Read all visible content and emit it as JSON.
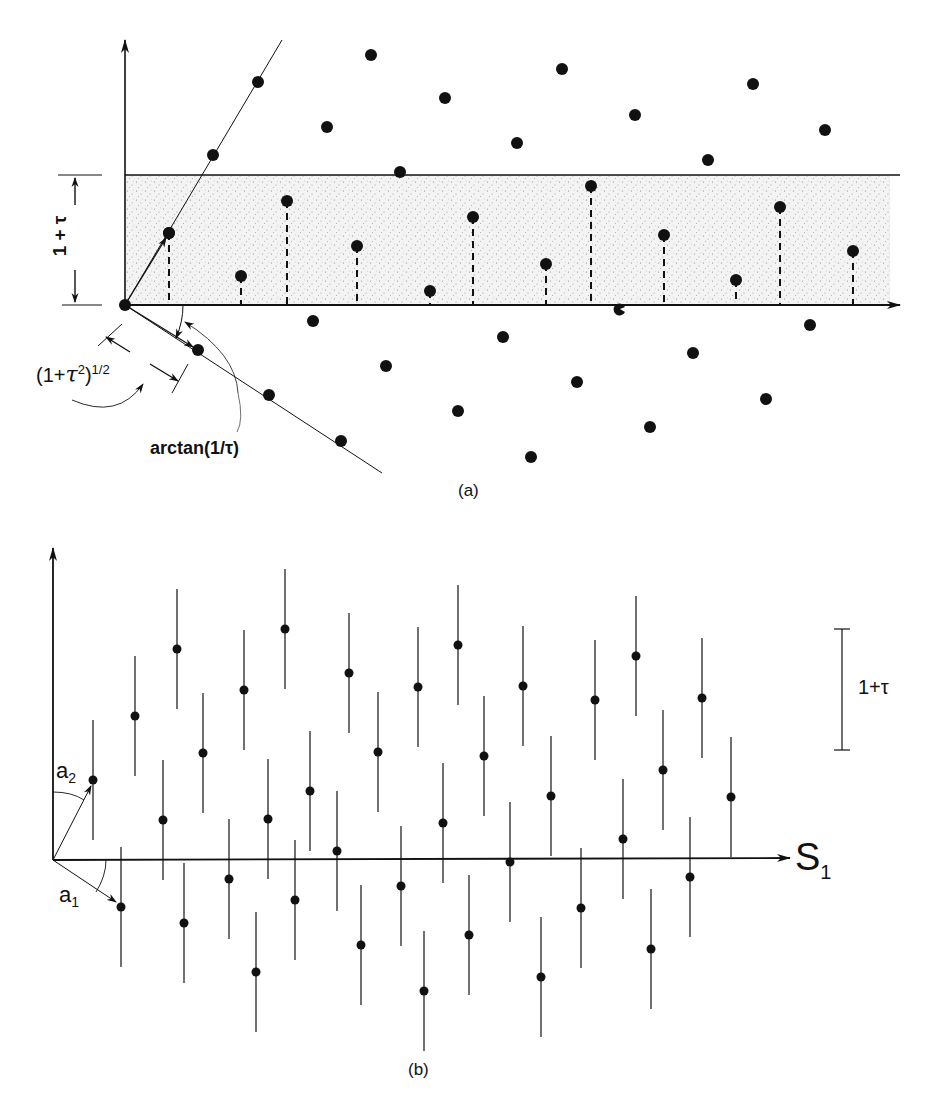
{
  "panel_a": {
    "caption": "(a)",
    "band_label": "1 + τ",
    "length_label": "(1+τ²)^1/2",
    "length_label_base": "(1+",
    "length_label_tau": "τ",
    "length_label_sq": "2",
    "length_label_close": ")",
    "length_label_exp": "1/2",
    "angle_label": "arctan(1/τ)",
    "colors": {
      "ink": "#111111",
      "band": "#f1f1f1",
      "stipple": "#8a8a8a"
    },
    "origin": [
      125,
      305
    ],
    "band_top_y": 175,
    "axis_end_x": 900,
    "upper_line": {
      "start": [
        125,
        305
      ],
      "end": [
        282,
        40
      ],
      "dots": [
        [
          169,
          233
        ],
        [
          213,
          155
        ],
        [
          258,
          82
        ]
      ]
    },
    "lower_line": {
      "start": [
        125,
        305
      ],
      "end": [
        382,
        473
      ],
      "dots": [
        [
          198,
          350
        ],
        [
          269,
          395
        ],
        [
          341,
          441
        ]
      ]
    },
    "lattice_dots": [
      [
        371,
        55
      ],
      [
        445,
        98
      ],
      [
        562,
        69
      ],
      [
        635,
        115
      ],
      [
        753,
        84
      ],
      [
        825,
        130
      ],
      [
        327,
        127
      ],
      [
        517,
        143
      ],
      [
        708,
        160
      ],
      [
        400,
        172
      ],
      [
        313,
        321
      ],
      [
        503,
        337
      ],
      [
        693,
        353
      ],
      [
        386,
        366
      ],
      [
        577,
        382
      ],
      [
        766,
        399
      ],
      [
        458,
        411
      ],
      [
        650,
        427
      ],
      [
        531,
        457
      ],
      [
        810,
        325
      ]
    ],
    "projected_dots": [
      [
        169,
        233
      ],
      [
        241,
        276
      ],
      [
        287,
        201
      ],
      [
        357,
        246
      ],
      [
        430,
        291
      ],
      [
        473,
        217
      ],
      [
        546,
        264
      ],
      [
        591,
        186
      ],
      [
        664,
        235
      ],
      [
        736,
        280
      ],
      [
        780,
        207
      ],
      [
        853,
        251
      ]
    ],
    "half_dot": [
      620,
      309
    ]
  },
  "panel_b": {
    "caption": "(b)",
    "axis_label": "S",
    "axis_label_sub": "1",
    "vec1_label": "a",
    "vec1_sub": "1",
    "vec2_label": "a",
    "vec2_sub": "2",
    "scale_label": "1+τ",
    "origin": [
      53,
      860
    ],
    "axis_end_x": 790,
    "scale_bar": {
      "x": 842,
      "y1": 629,
      "y2": 750
    },
    "bar_half_length": 60,
    "points": [
      [
        93,
        780
      ],
      [
        135,
        716
      ],
      [
        177,
        649
      ],
      [
        203,
        753
      ],
      [
        244,
        690
      ],
      [
        285,
        629
      ],
      [
        310,
        791
      ],
      [
        349,
        673
      ],
      [
        378,
        752
      ],
      [
        418,
        687
      ],
      [
        458,
        645
      ],
      [
        484,
        756
      ],
      [
        523,
        686
      ],
      [
        551,
        796
      ],
      [
        595,
        700
      ],
      [
        636,
        656
      ],
      [
        663,
        770
      ],
      [
        702,
        698
      ],
      [
        731,
        797
      ],
      [
        163,
        820
      ],
      [
        121,
        907
      ],
      [
        229,
        879
      ],
      [
        184,
        923
      ],
      [
        256,
        972
      ],
      [
        268,
        819
      ],
      [
        295,
        900
      ],
      [
        337,
        851
      ],
      [
        361,
        945
      ],
      [
        401,
        886
      ],
      [
        443,
        823
      ],
      [
        424,
        991
      ],
      [
        469,
        935
      ],
      [
        510,
        862
      ],
      [
        541,
        977
      ],
      [
        581,
        908
      ],
      [
        623,
        839
      ],
      [
        651,
        949
      ],
      [
        690,
        877
      ]
    ]
  }
}
